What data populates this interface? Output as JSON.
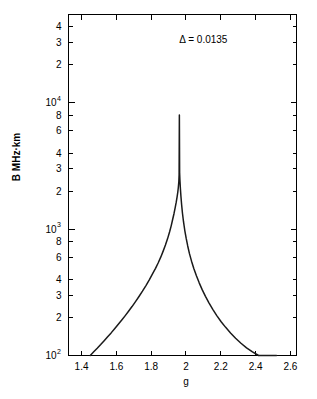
{
  "chart_data": {
    "type": "line",
    "title": "",
    "xlabel": "g",
    "ylabel": "B MHz·km",
    "xscale": "linear",
    "yscale": "log",
    "xlim": [
      1.325,
      2.635
    ],
    "ylim": [
      100,
      50000
    ],
    "grid": false,
    "legend": false,
    "annotations": [
      {
        "name": "delta-annotation",
        "text": "Δ = 0.0135",
        "x": 2.1,
        "y": 30000
      }
    ],
    "xticks": [
      1.4,
      1.6,
      1.8,
      2.0,
      2.2,
      2.4,
      2.6
    ],
    "xtick_labels": [
      "1.4",
      "1.6",
      "1.8",
      "2",
      "2.2",
      "2.4",
      "2.6"
    ],
    "yticks": [
      100,
      200,
      300,
      400,
      600,
      800,
      1000,
      2000,
      3000,
      4000,
      6000,
      8000,
      10000,
      20000,
      30000,
      40000
    ],
    "ytick_labels": [
      "10",
      "2",
      "3",
      "4",
      "6",
      "8",
      "10",
      "2",
      "3",
      "4",
      "6",
      "8",
      "10",
      "2",
      "3",
      "4"
    ],
    "ytick_exponents": [
      "2",
      "",
      "",
      "",
      "",
      "",
      "3",
      "",
      "",
      "",
      "",
      "",
      "4",
      "",
      "",
      ""
    ],
    "ytick_labeled": [
      true,
      true,
      true,
      true,
      true,
      true,
      true,
      true,
      true,
      true,
      true,
      true,
      true,
      true,
      true,
      true
    ],
    "series": [
      {
        "name": "resonance-curve",
        "color": "#1a1a1a",
        "peak_x": 1.962,
        "peak_y": 8000,
        "delta": 0.0135,
        "x": [
          1.45,
          1.47,
          1.49,
          1.51,
          1.53,
          1.55,
          1.57,
          1.59,
          1.61,
          1.63,
          1.65,
          1.67,
          1.69,
          1.71,
          1.73,
          1.75,
          1.77,
          1.79,
          1.81,
          1.825,
          1.84,
          1.855,
          1.87,
          1.882,
          1.894,
          1.906,
          1.915,
          1.924,
          1.931,
          1.938,
          1.944,
          1.949,
          1.953,
          1.956,
          1.959,
          1.9605,
          1.962,
          1.9635,
          1.965,
          1.968,
          1.971,
          1.975,
          1.98,
          1.986,
          1.993,
          2.001,
          2.01,
          2.02,
          2.032,
          2.045,
          2.06,
          2.076,
          2.093,
          2.112,
          2.132,
          2.154,
          2.177,
          2.202,
          2.228,
          2.256,
          2.285,
          2.316,
          2.348,
          2.382,
          2.417,
          2.454,
          2.492,
          2.52
        ],
        "y": [
          100,
          107,
          114,
          122,
          131,
          141,
          151,
          163,
          176,
          190,
          206,
          224,
          244,
          267,
          293,
          323,
          358,
          399,
          448,
          490,
          540,
          600,
          676,
          748,
          838,
          953,
          1062,
          1203,
          1325,
          1479,
          1634,
          1800,
          1966,
          2136,
          2392,
          2700,
          8000,
          2800,
          2470,
          2090,
          1820,
          1560,
          1330,
          1140,
          980,
          848,
          736,
          640,
          558,
          488,
          428,
          376,
          332,
          294,
          261,
          232,
          207,
          185,
          167,
          151,
          137,
          125,
          115,
          107,
          100,
          100,
          100,
          100
        ]
      }
    ]
  },
  "figure": {
    "name": "resonance-plot",
    "background": "#ffffff",
    "foreground": "#000000"
  }
}
